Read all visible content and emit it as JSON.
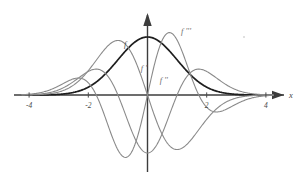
{
  "figure": {
    "title": "",
    "background_color": "#ffffff",
    "width": 302,
    "height": 185
  },
  "axes": {
    "x_axis_label": "x",
    "y_axis_label": "",
    "x_ticks": [
      {
        "value": -4,
        "label": "-4"
      },
      {
        "value": -2,
        "label": "-2"
      },
      {
        "value": 2,
        "label": "2"
      },
      {
        "value": 4,
        "label": "4"
      }
    ],
    "x_axis_color": "#3c3c3c",
    "y_axis_color": "#3c3c3c",
    "arrowheads": "both-axes-positive-direction"
  },
  "curve_labels": [
    {
      "id": "f",
      "text": "f",
      "x": -0.75,
      "y": 0.82
    },
    {
      "id": "f1",
      "text": "f '",
      "x": -0.12,
      "y": 0.42
    },
    {
      "id": "f2",
      "text": "f ''",
      "x": 0.55,
      "y": 0.2
    },
    {
      "id": "f3",
      "text": "f '''",
      "x": 1.3,
      "y": 1.05
    }
  ],
  "chart_data": {
    "type": "line",
    "title": "",
    "subtitle": "",
    "xlabel": "x",
    "ylabel": "",
    "xlim": [
      -4.35,
      4.35
    ],
    "ylim": [
      -1.35,
      1.25
    ],
    "grid": false,
    "legend": "inline-curve-labels",
    "x_tick_labels": [
      "-4",
      "-2",
      "2",
      "4"
    ],
    "x_tick_values": [
      -4,
      -2,
      2,
      4
    ],
    "annotations": [
      "f",
      "f '",
      "f ''",
      "f '''"
    ],
    "series": [
      {
        "name": "f",
        "label": "f",
        "color": "#1e1e1e",
        "width": 1.7,
        "formula": "exp(-x^2/2)",
        "scale": 1.0,
        "key_points": [
          {
            "x": -4,
            "y": 0.0
          },
          {
            "x": -3,
            "y": 0.01
          },
          {
            "x": -2,
            "y": 0.14
          },
          {
            "x": -1,
            "y": 0.61
          },
          {
            "x": 0,
            "y": 1.0
          },
          {
            "x": 1,
            "y": 0.61
          },
          {
            "x": 2,
            "y": 0.14
          },
          {
            "x": 3,
            "y": 0.01
          },
          {
            "x": 4,
            "y": 0.0
          }
        ]
      },
      {
        "name": "f'",
        "label": "f '",
        "color": "#8a8a8a",
        "width": 1.1,
        "formula": "-x*exp(-x^2/2)",
        "scale": 1.55,
        "key_points": [
          {
            "x": -4,
            "y": 0.0
          },
          {
            "x": -2,
            "y": 0.42
          },
          {
            "x": -1,
            "y": 0.94
          },
          {
            "x": 0,
            "y": 0.0
          },
          {
            "x": 1,
            "y": -0.94
          },
          {
            "x": 2,
            "y": -0.42
          },
          {
            "x": 4,
            "y": 0.0
          }
        ]
      },
      {
        "name": "f''",
        "label": "f ''",
        "color": "#8a8a8a",
        "width": 1.1,
        "formula": "(x^2-1)*exp(-x^2/2)",
        "scale": 1.0,
        "key_points": [
          {
            "x": -4,
            "y": 0.0
          },
          {
            "x": -2.5,
            "y": 0.37
          },
          {
            "x": -1.73,
            "y": 0.45
          },
          {
            "x": -1,
            "y": 0.0
          },
          {
            "x": 0,
            "y": -1.0
          },
          {
            "x": 1,
            "y": 0.0
          },
          {
            "x": 1.73,
            "y": 0.45
          },
          {
            "x": 2.5,
            "y": 0.37
          },
          {
            "x": 4,
            "y": 0.0
          }
        ]
      },
      {
        "name": "f'''",
        "label": "f '''",
        "color": "#8a8a8a",
        "width": 1.1,
        "formula": "-x*(x^2-3)*exp(-x^2/2)",
        "scale": 0.78,
        "key_points": [
          {
            "x": -4,
            "y": 0.0
          },
          {
            "x": -3,
            "y": -0.2
          },
          {
            "x": -2.33,
            "y": -0.36
          },
          {
            "x": -1.73,
            "y": 0.0
          },
          {
            "x": -0.74,
            "y": 1.2
          },
          {
            "x": 0,
            "y": 0.0
          },
          {
            "x": 0.74,
            "y": -1.2
          },
          {
            "x": 1.73,
            "y": 0.0
          },
          {
            "x": 2.33,
            "y": 0.36
          },
          {
            "x": 3,
            "y": 0.2
          },
          {
            "x": 4,
            "y": 0.0
          }
        ]
      }
    ]
  }
}
